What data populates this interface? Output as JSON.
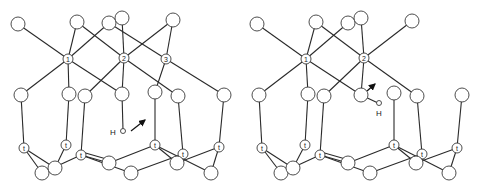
{
  "figure": {
    "panels": [
      {
        "id": "left",
        "description": "Silicate cluster with Si sites 1, 2, 3 and H atom with arrow indicating motion",
        "si_labels": [
          "1",
          "2",
          "3"
        ],
        "lower_si_label": "t",
        "h_label": "H"
      },
      {
        "id": "right",
        "description": "Silicate cluster with Si sites 1, 2 and H atom bonded to oxygen, arrow indicating motion",
        "si_labels": [
          "1",
          "2"
        ],
        "lower_si_label": "t",
        "h_label": "H"
      }
    ],
    "colors": {
      "line": "#2a2a2a",
      "atom_fill": "#ffffff",
      "atom_stroke": "#3a3a3a",
      "background": "#ffffff"
    }
  }
}
